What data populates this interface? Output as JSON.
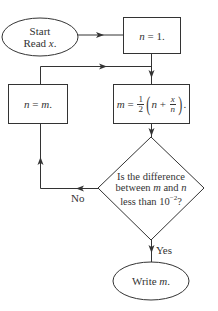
{
  "diagram": {
    "type": "flowchart",
    "title": "",
    "nodes": [
      {
        "id": "start",
        "shape": "ellipse",
        "line1": "Start",
        "line2_prefix": "Read ",
        "line2_var": "x",
        "line2_suffix": "."
      },
      {
        "id": "init",
        "shape": "rectangle",
        "var": "n",
        "text": " = 1."
      },
      {
        "id": "compute",
        "shape": "rectangle",
        "lhs": "m",
        "eq": " = ",
        "half_num": "1",
        "half_den": "2",
        "lparen": "(",
        "n": "n",
        "plus": " + ",
        "frac_num": "x",
        "frac_den": "n",
        "rparen": ")",
        "end": "."
      },
      {
        "id": "update",
        "shape": "rectangle",
        "var_n": "n",
        "eq": " = ",
        "var_m": "m",
        "end": "."
      },
      {
        "id": "decision",
        "shape": "diamond",
        "line1": "Is the difference",
        "line2_pre": "between ",
        "line2_m": "m",
        "line2_and": " and ",
        "line2_n": "n",
        "line3": "less than 10",
        "line3_exp": "−2",
        "line3_end": "?"
      },
      {
        "id": "output",
        "shape": "ellipse",
        "text": "Write ",
        "var": "m",
        "end": "."
      }
    ],
    "edges": [
      {
        "from": "start",
        "to": "init",
        "label": ""
      },
      {
        "from": "init",
        "to": "compute",
        "label": ""
      },
      {
        "from": "compute",
        "to": "decision",
        "label": ""
      },
      {
        "from": "decision",
        "to": "update",
        "label": "No"
      },
      {
        "from": "update",
        "to": "compute",
        "label": ""
      },
      {
        "from": "decision",
        "to": "output",
        "label": "Yes"
      }
    ],
    "labels": {
      "no": "No",
      "yes": "Yes"
    },
    "colors": {
      "stroke": "#333333",
      "background": "#ffffff"
    }
  }
}
